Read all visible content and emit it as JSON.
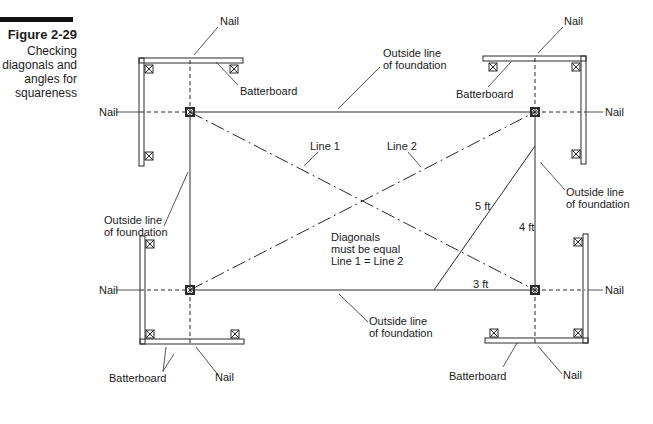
{
  "figure": {
    "number": "Figure 2-29",
    "caption_lines": [
      "Checking",
      "diagonals and",
      "angles for",
      "squareness"
    ]
  },
  "labels": {
    "nail": "Nail",
    "batterboard": "Batterboard",
    "outside_line_1": "Outside line",
    "outside_line_2": "of foundation",
    "line1": "Line 1",
    "line2": "Line 2",
    "five_ft": "5 ft",
    "four_ft": "4 ft",
    "three_ft": "3 ft",
    "diagonals_1": "Diagonals",
    "diagonals_2": "must be equal",
    "diagonals_3": "Line 1 = Line 2"
  },
  "colors": {
    "line": "#2a2a2a",
    "text": "#1a1a1a",
    "caption_bar": "#111111"
  }
}
